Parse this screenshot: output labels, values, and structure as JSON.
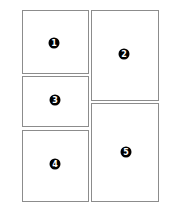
{
  "layout": {
    "panels": [
      {
        "id": 1,
        "label": "1",
        "x": 22,
        "y": 10,
        "w": 67,
        "h": 64,
        "cx": 54,
        "cy": 43
      },
      {
        "id": 2,
        "label": "2",
        "x": 91,
        "y": 10,
        "w": 68,
        "h": 91,
        "cx": 124,
        "cy": 54
      },
      {
        "id": 3,
        "label": "3",
        "x": 22,
        "y": 76,
        "w": 67,
        "h": 51,
        "cx": 55,
        "cy": 100
      },
      {
        "id": 4,
        "label": "4",
        "x": 22,
        "y": 130,
        "w": 67,
        "h": 72,
        "cx": 55,
        "cy": 164
      },
      {
        "id": 5,
        "label": "5",
        "x": 91,
        "y": 103,
        "w": 68,
        "h": 99,
        "cx": 126,
        "cy": 152
      }
    ],
    "colors": {
      "border": "#8c8c8c",
      "badge": "#000000",
      "badge_text": "#ffffff",
      "background": "#ffffff"
    }
  }
}
